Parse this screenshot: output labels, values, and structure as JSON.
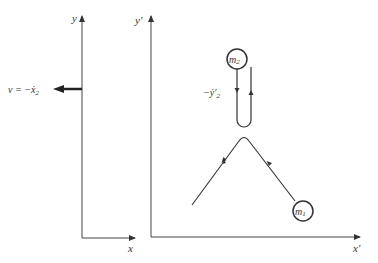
{
  "left_frame": {
    "y_label": "y",
    "x_label": "x",
    "velocity_label": "v = −ẋ",
    "velocity_sub": "2"
  },
  "right_frame": {
    "y_label": "y′",
    "x_label": "x′",
    "velocity_label": "−ẏ′",
    "velocity_sub": "2"
  },
  "masses": [
    {
      "label": "m",
      "sub": "2"
    },
    {
      "label": "m",
      "sub": "1"
    }
  ]
}
